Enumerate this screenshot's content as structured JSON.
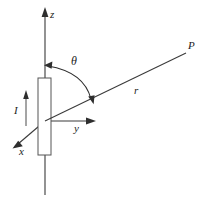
{
  "figure": {
    "kind": "physics-coordinate-diagram",
    "background_color": "#ffffff",
    "line_color": "#3a3a3a",
    "label_color": "#1c1c1c",
    "labels": {
      "z_axis": "z",
      "y_axis": "y",
      "x_axis": "x",
      "point_p": "P",
      "radius": "r",
      "theta": "θ",
      "current": "I"
    },
    "geometry": {
      "origin": {
        "x": 45,
        "y": 121
      },
      "z_axis_tip": {
        "x": 45,
        "y": 10
      },
      "z_axis_base": {
        "x": 45,
        "y": 195
      },
      "y_axis_tip": {
        "x": 95,
        "y": 121
      },
      "x_axis_tip": {
        "x": 14,
        "y": 147
      },
      "point_p": {
        "x": 188,
        "y": 52
      },
      "antenna_rect": {
        "x": 38,
        "y": 78,
        "width": 13,
        "height": 77
      },
      "current_arrow": {
        "x": 26,
        "y_bottom": 126,
        "y_top": 91
      },
      "theta_arc_start": {
        "x": 45,
        "y": 66
      },
      "theta_arc_end": {
        "x": 93,
        "y": 101
      }
    }
  }
}
